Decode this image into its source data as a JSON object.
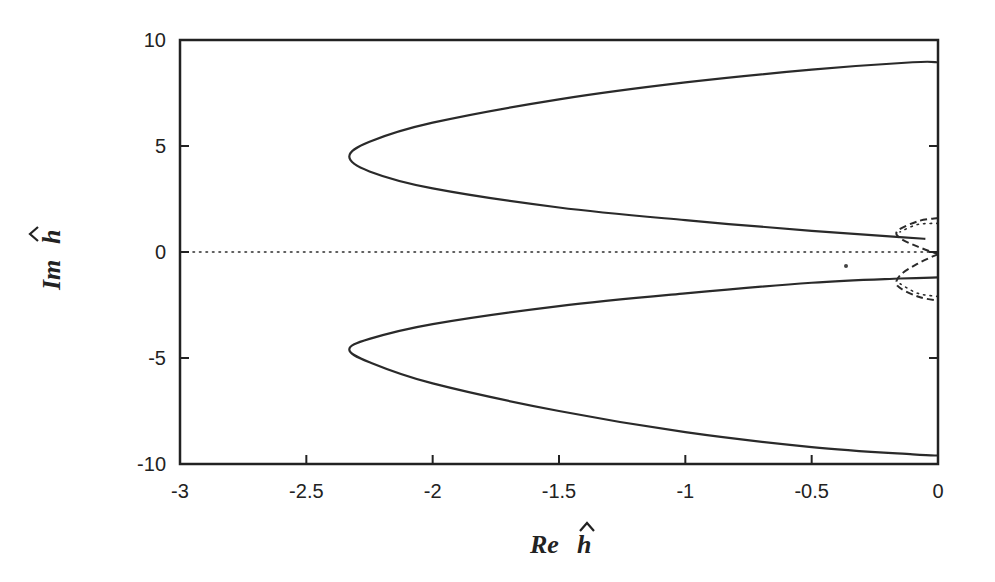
{
  "chart_data": {
    "type": "line",
    "title": "",
    "xlabel": "Re ĥ",
    "ylabel": "Im ĥ",
    "xlabel_parts": {
      "prefix": "Re",
      "symbol": "h"
    },
    "ylabel_parts": {
      "prefix": "Im",
      "symbol": "h"
    },
    "xlim": [
      -3,
      0
    ],
    "ylim": [
      -10,
      10
    ],
    "xticks": [
      -3,
      -2.5,
      -2,
      -1.5,
      -1,
      -0.5,
      0
    ],
    "xtick_labels": [
      "-3",
      "-2.5",
      "-2",
      "-1.5",
      "-1",
      "-0.5",
      "0"
    ],
    "yticks": [
      10,
      5,
      0,
      -5,
      -10
    ],
    "ytick_labels": [
      "10",
      "5",
      "0",
      "-5",
      "-10"
    ],
    "grid": false,
    "legend": null,
    "series": [
      {
        "name": "upper branch (solid)",
        "style": "solid",
        "points": [
          [
            -0.05,
            0.62
          ],
          [
            -0.15,
            0.7
          ],
          [
            -0.5,
            1.0
          ],
          [
            -1.0,
            1.5
          ],
          [
            -1.5,
            2.1
          ],
          [
            -2.0,
            3.0
          ],
          [
            -2.25,
            3.8
          ],
          [
            -2.33,
            4.5
          ],
          [
            -2.25,
            5.2
          ],
          [
            -2.0,
            6.1
          ],
          [
            -1.5,
            7.2
          ],
          [
            -1.0,
            8.0
          ],
          [
            -0.5,
            8.6
          ],
          [
            -0.1,
            8.95
          ],
          [
            0,
            8.95
          ]
        ]
      },
      {
        "name": "lower branch (solid)",
        "style": "solid",
        "points": [
          [
            0,
            -1.2
          ],
          [
            -0.15,
            -1.25
          ],
          [
            -0.5,
            -1.45
          ],
          [
            -1.0,
            -1.95
          ],
          [
            -1.5,
            -2.55
          ],
          [
            -2.0,
            -3.4
          ],
          [
            -2.25,
            -4.1
          ],
          [
            -2.33,
            -4.6
          ],
          [
            -2.25,
            -5.2
          ],
          [
            -2.0,
            -6.2
          ],
          [
            -1.5,
            -7.5
          ],
          [
            -1.0,
            -8.5
          ],
          [
            -0.5,
            -9.2
          ],
          [
            -0.1,
            -9.55
          ],
          [
            0,
            -9.6
          ]
        ]
      },
      {
        "name": "real axis (dotted)",
        "style": "dotted",
        "points": [
          [
            -3,
            0
          ],
          [
            0,
            0
          ]
        ]
      },
      {
        "name": "small loop upper (dashed)",
        "style": "dashed",
        "points": [
          [
            0,
            1.6
          ],
          [
            -0.08,
            1.45
          ],
          [
            -0.16,
            1.0
          ],
          [
            -0.15,
            0.65
          ],
          [
            -0.08,
            0.25
          ],
          [
            0,
            -0.1
          ]
        ]
      },
      {
        "name": "small loop upper (dotted)",
        "style": "dotted",
        "points": [
          [
            0,
            1.35
          ],
          [
            -0.08,
            1.3
          ],
          [
            -0.15,
            0.95
          ]
        ]
      },
      {
        "name": "small loop lower (dashed)",
        "style": "dashed",
        "points": [
          [
            0,
            -0.1
          ],
          [
            -0.08,
            -0.55
          ],
          [
            -0.15,
            -1.1
          ],
          [
            -0.16,
            -1.6
          ],
          [
            -0.08,
            -2.1
          ],
          [
            0,
            -2.3
          ]
        ]
      },
      {
        "name": "small loop lower (dotted)",
        "style": "dotted",
        "points": [
          [
            -0.15,
            -1.5
          ],
          [
            -0.08,
            -1.95
          ],
          [
            0,
            -2.1
          ]
        ]
      }
    ]
  }
}
